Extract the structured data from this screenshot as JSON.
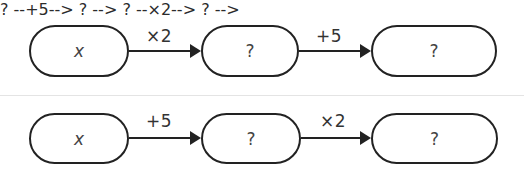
{
  "diagrams": [
    {
      "name": "double-then-add",
      "nodes": [
        {
          "label": "x",
          "italic": true
        },
        {
          "label": "?",
          "italic": false
        },
        {
          "label": "?",
          "italic": false
        }
      ],
      "operations": [
        "×2",
        "+5"
      ]
    },
    {
      "name": "add-then-double",
      "nodes": [
        {
          "label": "x",
          "italic": true
        },
        {
          "label": "?",
          "italic": false
        },
        {
          "label": "?",
          "italic": false
        }
      ],
      "operations": [
        "+5",
        "×2"
      ]
    }
  ]
}
